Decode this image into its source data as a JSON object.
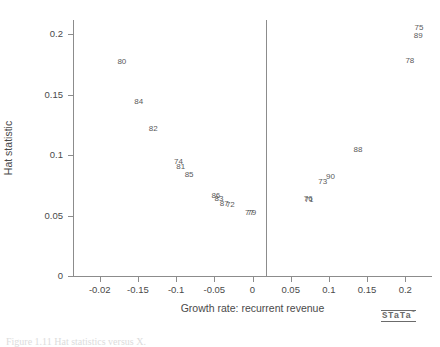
{
  "chart_data": {
    "type": "scatter",
    "title": "",
    "xlabel": "Growth rate: recurrent revenue",
    "ylabel": "Hat statistic",
    "xlim": [
      -0.235,
      0.235
    ],
    "ylim": [
      0,
      0.212
    ],
    "grid": false,
    "legend": null,
    "marker_style": "observation-id-text-labels",
    "annotations": [
      {
        "name": "vertical-reference-line",
        "x": 0.018,
        "orientation": "vertical"
      }
    ],
    "xticks": [
      {
        "value": -0.2,
        "label": "-0.02"
      },
      {
        "value": -0.15,
        "label": "-0.15"
      },
      {
        "value": -0.1,
        "label": "-0.1"
      },
      {
        "value": -0.05,
        "label": "-0.05"
      },
      {
        "value": 0,
        "label": "0"
      },
      {
        "value": 0.05,
        "label": "0.05"
      },
      {
        "value": 0.1,
        "label": "0.1"
      },
      {
        "value": 0.15,
        "label": "0.15"
      },
      {
        "value": 0.2,
        "label": "0.2"
      }
    ],
    "yticks": [
      {
        "value": 0,
        "label": "0"
      },
      {
        "value": 0.05,
        "label": "0.05"
      },
      {
        "value": 0.1,
        "label": "0.1"
      },
      {
        "value": 0.15,
        "label": "0.15"
      },
      {
        "value": 0.2,
        "label": "0.2"
      }
    ],
    "points": [
      {
        "label": "75",
        "x": 0.218,
        "y": 0.205
      },
      {
        "label": "89",
        "x": 0.217,
        "y": 0.199
      },
      {
        "label": "78",
        "x": 0.206,
        "y": 0.178
      },
      {
        "label": "80",
        "x": -0.171,
        "y": 0.177
      },
      {
        "label": "84",
        "x": -0.149,
        "y": 0.144
      },
      {
        "label": "82",
        "x": -0.13,
        "y": 0.122
      },
      {
        "label": "88",
        "x": 0.138,
        "y": 0.104
      },
      {
        "label": "74",
        "x": -0.097,
        "y": 0.094
      },
      {
        "label": "81",
        "x": -0.094,
        "y": 0.09
      },
      {
        "label": "85",
        "x": -0.083,
        "y": 0.084
      },
      {
        "label": "90",
        "x": 0.102,
        "y": 0.082
      },
      {
        "label": "73",
        "x": 0.092,
        "y": 0.078
      },
      {
        "label": "86",
        "x": -0.048,
        "y": 0.066
      },
      {
        "label": "83",
        "x": -0.044,
        "y": 0.064
      },
      {
        "label": "76",
        "x": 0.073,
        "y": 0.064
      },
      {
        "label": "71",
        "x": 0.074,
        "y": 0.063
      },
      {
        "label": "87",
        "x": -0.037,
        "y": 0.06
      },
      {
        "label": "72",
        "x": -0.029,
        "y": 0.059
      },
      {
        "label": "77",
        "x": -0.004,
        "y": 0.052
      },
      {
        "label": "79",
        "x": -0.001,
        "y": 0.052
      }
    ]
  },
  "branding": {
    "logo_text": "STaTa",
    "logo_mark": "™"
  },
  "caption": {
    "text": "Figure 1.11  Hat statistics versus X."
  }
}
